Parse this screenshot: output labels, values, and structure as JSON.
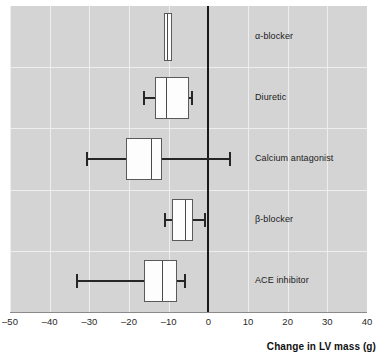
{
  "chart_data": {
    "type": "box",
    "title": "",
    "xlabel": "Change in LV mass (g)",
    "ylabel": "",
    "xlim": [
      -50,
      40
    ],
    "xticks": [
      -50,
      -40,
      -30,
      -20,
      -10,
      0,
      10,
      20,
      30,
      40
    ],
    "xtick_labels": [
      "–50",
      "–40",
      "–30",
      "–20",
      "–10",
      "0",
      "10",
      "20",
      "30",
      "40"
    ],
    "grid": true,
    "legend": false,
    "reference_line": 0,
    "orientation": "horizontal",
    "categories": [
      "α-blocker",
      "Diuretic",
      "Calcium antagonist",
      "β-blocker",
      "ACE inhibitor"
    ],
    "boxes": [
      {
        "label": "α-blocker",
        "whisker_low": -11.3,
        "q1": -11.3,
        "median": -10.3,
        "q3": -9.1,
        "whisker_high": -9.1,
        "caps": false
      },
      {
        "label": "Diuretic",
        "whisker_low": -16.1,
        "q1": -13.4,
        "median": -10.6,
        "q3": -4.8,
        "whisker_high": -4.0,
        "caps": true
      },
      {
        "label": "Calcium antagonist",
        "whisker_low": -30.7,
        "q1": -20.7,
        "median": -14.4,
        "q3": -11.6,
        "whisker_high": 5.5,
        "caps": true
      },
      {
        "label": "β-blocker",
        "whisker_low": -10.8,
        "q1": -9.1,
        "median": -6.0,
        "q3": -3.8,
        "whisker_high": -0.8,
        "caps": true
      },
      {
        "label": "ACE inhibitor",
        "whisker_low": -33.2,
        "q1": -16.1,
        "median": -11.6,
        "q3": -7.8,
        "whisker_high": -5.8,
        "caps": true
      }
    ]
  },
  "axis": {
    "title": "Change in LV mass (g)",
    "ticks": [
      "–50",
      "–40",
      "–30",
      "–20",
      "–10",
      "0",
      "10",
      "20",
      "30",
      "40"
    ]
  },
  "colors": {
    "panel_background": "#d4d4d4",
    "gridline": "#eeeeee",
    "box_fill": "#fdfdfd",
    "box_stroke": "#5a5a5a",
    "whisker": "#262626",
    "zero_line": "#1a1a1a",
    "text": "#1a1a1a"
  }
}
